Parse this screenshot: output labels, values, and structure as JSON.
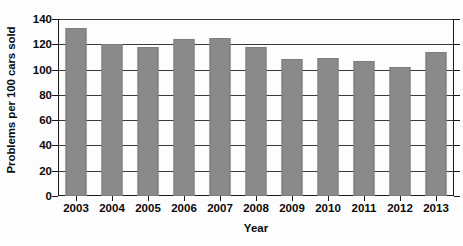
{
  "chart_data": {
    "type": "bar",
    "title": "",
    "xlabel": "Year",
    "ylabel": "Problems per 100 cars sold",
    "categories": [
      "2003",
      "2004",
      "2005",
      "2006",
      "2007",
      "2008",
      "2009",
      "2010",
      "2011",
      "2012",
      "2013"
    ],
    "values": [
      133,
      120,
      118,
      124,
      125,
      118,
      108,
      109,
      107,
      102,
      114
    ],
    "ylim": [
      0,
      140
    ],
    "ytick_labels": [
      "0",
      "20",
      "40",
      "60",
      "80",
      "100",
      "120",
      "140"
    ],
    "ytick_values": [
      0,
      20,
      40,
      60,
      80,
      100,
      120,
      140
    ],
    "grid": true,
    "legend": "none",
    "bar_color": "#8a8a8a",
    "axis_color": "#1a1a1a",
    "background_color": "#fdfdfd"
  }
}
